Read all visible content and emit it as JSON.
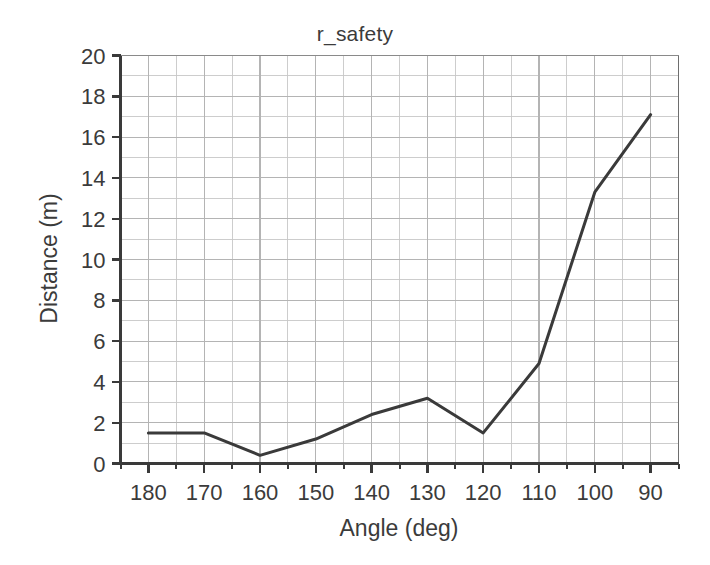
{
  "chart_data": {
    "type": "line",
    "title": "r_safety",
    "xlabel": "Angle (deg)",
    "ylabel": "Distance (m)",
    "x": [
      180,
      170,
      160,
      150,
      140,
      130,
      120,
      110,
      100,
      90
    ],
    "values": [
      1.5,
      1.5,
      0.4,
      1.2,
      2.4,
      3.2,
      1.5,
      4.9,
      13.3,
      17.1
    ],
    "series": [
      {
        "name": "r_safety",
        "values": [
          1.5,
          1.5,
          0.4,
          1.2,
          2.4,
          3.2,
          1.5,
          4.9,
          13.3,
          17.1
        ]
      }
    ],
    "xlim": [
      185,
      85
    ],
    "ylim": [
      0,
      20
    ],
    "x_tick_labels": [
      "180",
      "170",
      "160",
      "150",
      "140",
      "130",
      "120",
      "110",
      "100",
      "90"
    ],
    "y_tick_labels": [
      "0",
      "2",
      "4",
      "6",
      "8",
      "10",
      "12",
      "14",
      "16",
      "18",
      "20"
    ],
    "x_ticks": [
      180,
      170,
      160,
      150,
      140,
      130,
      120,
      110,
      100,
      90
    ],
    "y_ticks": [
      0,
      2,
      4,
      6,
      8,
      10,
      12,
      14,
      16,
      18,
      20
    ],
    "x_minor_step": 5,
    "y_minor_step": 1,
    "grid": true,
    "grid_minor": true,
    "legend": "none",
    "x_axis_inverted": true,
    "line_color": "#3a3a3a",
    "line_width": 3,
    "grid_color": "#c8c8c8",
    "axis_color": "#3a3a3a",
    "background_color": "#ffffff",
    "markers": "none"
  }
}
